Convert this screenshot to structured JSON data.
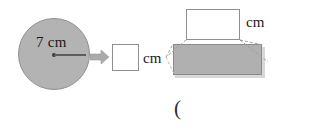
{
  "figure": {
    "circle": {
      "name": "shaded-circle",
      "radius_label": "7 cm",
      "fill_color": "#b3b3b3",
      "stroke_color": "#8f8f8f"
    },
    "arrow": {
      "name": "transform-arrow",
      "direction": "right",
      "color": "#a8a8a8"
    },
    "blanks": [
      {
        "id": "blank-left",
        "value": "",
        "placeholder": "",
        "unit": "cm"
      },
      {
        "id": "blank-top",
        "value": "",
        "placeholder": "",
        "unit": "cm"
      }
    ],
    "prism": {
      "name": "rectangular-prism",
      "fill_color": "#b0b0b0",
      "stroke_color": "#8a8a8a",
      "shadow_color": "#d8d8d8"
    },
    "caption": "("
  }
}
